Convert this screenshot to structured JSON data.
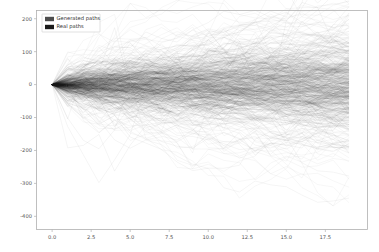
{
  "chart_data": {
    "type": "line",
    "title": "",
    "xlabel": "",
    "ylabel": "",
    "xlim": [
      -1.0,
      20.2
    ],
    "ylim": [
      -440,
      225
    ],
    "grid": false,
    "legend_position": "upper left",
    "xticks": [
      0.0,
      2.5,
      5.0,
      7.5,
      10.0,
      12.5,
      15.0,
      17.5
    ],
    "xtick_labels": [
      "0.0",
      "2.5",
      "5.0",
      "7.5",
      "10.0",
      "12.5",
      "15.0",
      "17.5"
    ],
    "yticks": [
      200,
      100,
      0,
      -100,
      -200,
      -300,
      -400
    ],
    "ytick_labels": [
      "200",
      "100",
      "0",
      "-100",
      "-200",
      "-300",
      "-400"
    ],
    "series": [
      {
        "name": "Generated paths",
        "color": "#3a3a3a",
        "alpha": 0.09,
        "linewidth": 0.45,
        "n_paths": 300,
        "start_value": 0,
        "t_start": 0,
        "t_end": 19,
        "n_steps": 19,
        "step_std": 22,
        "drift": 0.8,
        "seed": 7,
        "description": "Simulated random-walk sample paths, all starting at 0, fanning outward with time"
      },
      {
        "name": "Real paths",
        "color": "#111111",
        "alpha": 0.1,
        "linewidth": 0.45,
        "n_paths": 260,
        "start_value": 0,
        "t_start": 0,
        "t_end": 19,
        "n_steps": 19,
        "step_std": 19,
        "drift": 1.1,
        "seed": 23,
        "description": "Observed random-walk sample paths, all starting at 0, denser near the centre band"
      }
    ],
    "envelope": {
      "upper_at_t_end": 200,
      "lower_at_t_end": -130,
      "dense_band_upper_at_t_end": 70,
      "dense_band_lower_at_t_end": -40,
      "extreme_low_outlier": -350
    }
  },
  "legend": {
    "entries": [
      {
        "label": "Generated paths",
        "swatch_color": "#4d4d4d"
      },
      {
        "label": "Real paths",
        "swatch_color": "#1a1a1a"
      }
    ]
  },
  "axes": {
    "frame_color": "#b0b0b0",
    "tick_color": "#555555",
    "background": "#ffffff"
  }
}
